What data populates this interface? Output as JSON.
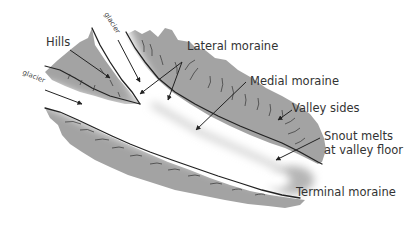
{
  "diagram": {
    "colors": {
      "rock": "#a3a3a3",
      "ice": "#ffffff",
      "outline": "#222222",
      "text": "#333333",
      "background": "#ffffff"
    },
    "labels": {
      "hills": "Hills",
      "glacier_top": "glacier",
      "glacier_left": "glacier",
      "lateral_moraine": "Lateral moraine",
      "medial_moraine": "Medial moraine",
      "valley_sides": "Valley sides",
      "snout_line1": "Snout melts",
      "snout_line2": "at valley floor",
      "terminal_moraine": "Terminal moraine"
    }
  }
}
